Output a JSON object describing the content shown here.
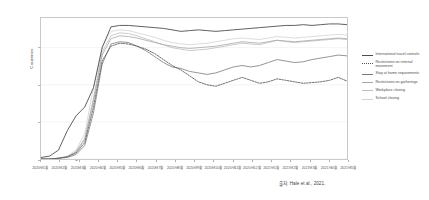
{
  "chart": {
    "type": "line",
    "y_axis_title": "Countries",
    "source_note": "출처: Hale et al., 2021."
  },
  "chart_data": {
    "type": "line",
    "title": "",
    "subtitle": "",
    "xlabel": "",
    "ylabel": "Countries",
    "ylim": [
      0,
      190
    ],
    "yticks": [
      0,
      50,
      100,
      150
    ],
    "grid": true,
    "legend_position": "right",
    "x_tick_labels": [
      "2020년1월",
      "2020년2월",
      "2020년3월",
      "2020년4월",
      "2020년5월",
      "2020년6월",
      "2020년7월",
      "2020년8월",
      "2020년9월",
      "2020년10월",
      "2020년11월",
      "2020년12월",
      "2021년1월",
      "2021년2월",
      "2021년3월",
      "2021년4월",
      "2021년5월"
    ],
    "x": [
      "2020-01-01",
      "2020-01-15",
      "2020-02-01",
      "2020-02-15",
      "2020-03-01",
      "2020-03-08",
      "2020-03-15",
      "2020-03-22",
      "2020-04-01",
      "2020-04-15",
      "2020-05-01",
      "2020-05-15",
      "2020-06-01",
      "2020-06-15",
      "2020-07-01",
      "2020-07-15",
      "2020-08-01",
      "2020-08-15",
      "2020-09-01",
      "2020-09-15",
      "2020-10-01",
      "2020-10-15",
      "2020-11-01",
      "2020-11-15",
      "2020-12-01",
      "2020-12-15",
      "2021-01-01",
      "2021-01-15",
      "2021-02-01",
      "2021-02-15",
      "2021-03-01",
      "2021-03-15",
      "2021-04-01",
      "2021-04-15",
      "2021-05-01",
      "2021-05-15"
    ],
    "series": [
      {
        "name": "International travel controls",
        "color": "#4d4d4d",
        "width": 0.9,
        "dash": "none",
        "values": [
          2,
          4,
          12,
          38,
          58,
          70,
          96,
          150,
          178,
          180,
          180,
          179,
          178,
          177,
          176,
          174,
          172,
          173,
          174,
          173,
          172,
          173,
          174,
          175,
          176,
          177,
          178,
          179,
          180,
          180,
          181,
          180,
          181,
          182,
          182,
          181
        ]
      },
      {
        "name": "Restrictions on internal movement",
        "color": "#555555",
        "width": 0.85,
        "dash": "dotted",
        "values": [
          0,
          0,
          1,
          3,
          8,
          22,
          70,
          132,
          152,
          156,
          155,
          152,
          148,
          142,
          134,
          126,
          120,
          112,
          104,
          100,
          98,
          102,
          106,
          110,
          106,
          102,
          104,
          108,
          106,
          104,
          102,
          103,
          104,
          106,
          110,
          105
        ]
      },
      {
        "name": "Stay at home requirements",
        "color": "#7a7a7a",
        "width": 0.8,
        "dash": "none",
        "values": [
          0,
          0,
          1,
          2,
          6,
          18,
          62,
          128,
          155,
          158,
          157,
          152,
          146,
          138,
          130,
          124,
          122,
          118,
          116,
          114,
          116,
          120,
          124,
          126,
          124,
          126,
          130,
          134,
          132,
          130,
          131,
          134,
          136,
          138,
          140,
          139
        ]
      },
      {
        "name": "Restrictions on gatherings",
        "color": "#a6a6a6",
        "width": 0.8,
        "dash": "none",
        "values": [
          0,
          0,
          1,
          3,
          9,
          26,
          78,
          140,
          162,
          166,
          165,
          163,
          160,
          157,
          154,
          152,
          150,
          149,
          150,
          151,
          152,
          154,
          156,
          158,
          157,
          156,
          158,
          160,
          159,
          158,
          159,
          160,
          161,
          162,
          163,
          162
        ]
      },
      {
        "name": "Workplace closing",
        "color": "#bdbdbd",
        "width": 0.8,
        "dash": "none",
        "values": [
          0,
          0,
          1,
          3,
          10,
          28,
          82,
          144,
          166,
          170,
          169,
          166,
          162,
          158,
          154,
          150,
          148,
          146,
          147,
          148,
          150,
          152,
          154,
          156,
          155,
          154,
          157,
          160,
          158,
          157,
          158,
          159,
          160,
          161,
          162,
          161
        ]
      },
      {
        "name": "School closing",
        "color": "#d2d2d2",
        "width": 0.8,
        "dash": "none",
        "values": [
          0,
          0,
          1,
          4,
          12,
          34,
          96,
          152,
          172,
          174,
          173,
          170,
          167,
          164,
          160,
          157,
          155,
          154,
          155,
          156,
          158,
          160,
          162,
          163,
          162,
          161,
          163,
          165,
          164,
          163,
          164,
          165,
          166,
          167,
          168,
          167
        ]
      }
    ]
  }
}
